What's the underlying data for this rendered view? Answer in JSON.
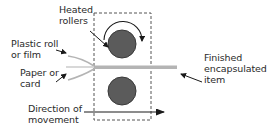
{
  "diagram": {
    "type": "encapsulation-laminator-process",
    "labels": {
      "heated_rollers": [
        "Heated",
        "rollers"
      ],
      "plastic_roll": [
        "Plastic roll",
        "or film"
      ],
      "paper_card": [
        "Paper or",
        "card"
      ],
      "direction": [
        "Direction of",
        "movement"
      ],
      "finished_item": [
        "Finished",
        "encapsulated",
        "item"
      ]
    },
    "colors": {
      "roller_fill": "#5b5b5b",
      "roller_stroke": "#3a3a3a",
      "sheet": "#b4b4b4",
      "text": "#2a2a2a",
      "arrow": "#1a1a1a",
      "dashed_box": "#555555"
    },
    "components": [
      {
        "name": "top-heated-roller",
        "shape": "circle"
      },
      {
        "name": "bottom-heated-roller",
        "shape": "circle"
      },
      {
        "name": "rotation-arrow",
        "shape": "clockwise-arc"
      },
      {
        "name": "machine-housing",
        "shape": "dashed-rectangle"
      },
      {
        "name": "encapsulated-sheet",
        "shape": "horizontal-bar"
      },
      {
        "name": "direction-arrow",
        "shape": "right-arrow"
      }
    ]
  }
}
